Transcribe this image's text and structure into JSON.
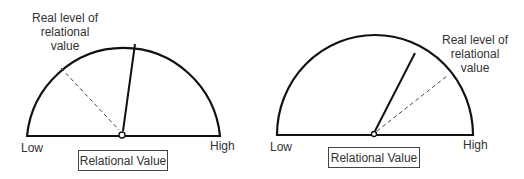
{
  "gauges": [
    {
      "id": "left",
      "annotation": [
        "Real level of",
        "relational",
        "value"
      ],
      "low_label": "Low",
      "high_label": "High",
      "box_label": "Relational Value",
      "solid_pointer": "perceived level, slightly right of center",
      "dashed_pointer": "real level, toward low"
    },
    {
      "id": "right",
      "annotation": [
        "Real level of",
        "relational",
        "value"
      ],
      "low_label": "Low",
      "high_label": "High",
      "box_label": "Relational Value",
      "solid_pointer": "perceived level, right of center",
      "dashed_pointer": "real level, toward high"
    }
  ],
  "colors": {
    "line": "#111111",
    "text": "#333333"
  }
}
